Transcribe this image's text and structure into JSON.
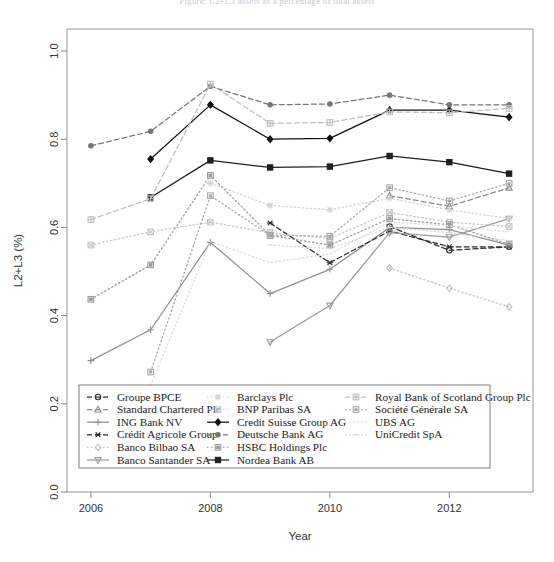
{
  "figure": {
    "title": "Figure: L2+L3 assets as a percentage of total assets",
    "width": 554,
    "height": 562
  },
  "chart_data": {
    "type": "line",
    "title": "",
    "xlabel": "Year",
    "ylabel": "L2+L3 (%)",
    "x": [
      2006,
      2007,
      2008,
      2009,
      2010,
      2011,
      2012,
      2013
    ],
    "xlim": [
      2005.6,
      2013.4
    ],
    "ylim": [
      0.0,
      1.05
    ],
    "xticks": [
      2006,
      2008,
      2010,
      2012
    ],
    "xtick_labels": [
      "2006",
      "2008",
      "2010",
      "2012"
    ],
    "yticks": [
      0.0,
      0.2,
      0.4,
      0.6,
      0.8,
      1.0
    ],
    "ytick_labels": [
      "0.0",
      "0.2",
      "0.4",
      "0.6",
      "0.8",
      "1.0"
    ],
    "grid": false,
    "legend_position": "bottom",
    "legend_columns": 3,
    "series": [
      {
        "name": "Groupe BPCE",
        "symbol": "circle-open",
        "dash": "dashed",
        "color": "#2b2b2b",
        "values": [
          null,
          null,
          null,
          null,
          null,
          0.602,
          0.548,
          0.556
        ]
      },
      {
        "name": "Standard Chartered Plc",
        "symbol": "triangle-open",
        "dash": "dashed",
        "color": "#8c8c8c",
        "values": [
          null,
          null,
          null,
          null,
          null,
          0.672,
          0.648,
          0.69
        ]
      },
      {
        "name": "ING Bank NV",
        "symbol": "plus",
        "dash": "solid",
        "color": "#8f8f8f",
        "values": [
          0.298,
          0.368,
          0.566,
          0.45,
          0.505,
          0.6,
          0.595,
          0.56
        ]
      },
      {
        "name": "Crédit Agricole Group",
        "symbol": "asterisk",
        "dash": "dashed",
        "color": "#2b2b2b",
        "values": [
          null,
          null,
          null,
          0.61,
          0.52,
          0.592,
          0.556,
          0.556
        ]
      },
      {
        "name": "Banco Bilbao SA",
        "symbol": "diamond-open",
        "dash": "dotted",
        "color": "#c0c0c0",
        "values": [
          null,
          null,
          null,
          null,
          null,
          0.508,
          0.462,
          0.42
        ]
      },
      {
        "name": "Banco Santander SA",
        "symbol": "triangle-down-open",
        "dash": "solid",
        "color": "#9a9a9a",
        "values": [
          null,
          null,
          null,
          0.34,
          0.423,
          0.588,
          0.578,
          0.62
        ]
      },
      {
        "name": "Barclays Plc",
        "symbol": "star",
        "dash": "dotted",
        "color": "#d2d2d2",
        "values": [
          null,
          null,
          0.7,
          0.65,
          0.64,
          0.666,
          0.64,
          0.62
        ]
      },
      {
        "name": "BNP Paribas SA",
        "symbol": "square-cross",
        "dash": "dotted",
        "color": "#c6c6c6",
        "values": [
          0.56,
          0.59,
          0.612,
          0.588,
          0.575,
          0.634,
          0.612,
          0.602
        ]
      },
      {
        "name": "Credit Suisse Group AG",
        "symbol": "diamond-filled",
        "dash": "solid",
        "color": "#111111",
        "values": [
          null,
          0.755,
          0.878,
          0.8,
          0.802,
          0.866,
          0.866,
          0.85
        ]
      },
      {
        "name": "Deutsche Bank AG",
        "symbol": "circle-filled",
        "dash": "dashed",
        "color": "#767676",
        "values": [
          0.785,
          0.818,
          0.92,
          0.878,
          0.88,
          0.9,
          0.878,
          0.878
        ]
      },
      {
        "name": "HSBC Holdings Plc",
        "symbol": "square-box",
        "dash": "dotted",
        "color": "#9c9c9c",
        "values": [
          0.437,
          0.515,
          0.718,
          0.582,
          0.56,
          0.62,
          0.606,
          0.562
        ]
      },
      {
        "name": "Nordea Bank AB",
        "symbol": "square-filled",
        "dash": "solid",
        "color": "#1f1f1f",
        "values": [
          null,
          0.668,
          0.752,
          0.736,
          0.738,
          0.762,
          0.748,
          0.722
        ]
      },
      {
        "name": "Royal Bank of Scotland Group Plc",
        "symbol": "square-plus",
        "dash": "dashed",
        "color": "#bdbdbd",
        "values": [
          0.618,
          0.665,
          0.925,
          0.836,
          0.838,
          0.862,
          0.86,
          0.87
        ]
      },
      {
        "name": "Société Générale SA",
        "symbol": "square-dot",
        "dash": "dotted",
        "color": "#a8a8a8",
        "values": [
          null,
          0.272,
          0.672,
          0.582,
          0.58,
          0.69,
          0.66,
          0.7
        ]
      },
      {
        "name": "UBS AG",
        "symbol": "none",
        "dash": "dotted",
        "color": "#dcdcdc",
        "values": [
          null,
          0.242,
          0.568,
          0.52,
          0.54,
          0.612,
          0.604,
          0.59
        ]
      },
      {
        "name": "UniCredit SpA",
        "symbol": "dash",
        "dash": "dotted",
        "color": "#d8d8d8",
        "values": [
          null,
          null,
          null,
          0.56,
          0.552,
          0.6,
          0.588,
          0.57
        ]
      }
    ]
  },
  "legend": {
    "columns": [
      [
        {
          "label": "Groupe BPCE",
          "symbol": "circle-open",
          "dash": "dashed",
          "color": "#2b2b2b"
        },
        {
          "label": "Standard Chartered Plc",
          "symbol": "triangle-open",
          "dash": "dashed",
          "color": "#8c8c8c"
        },
        {
          "label": "ING Bank NV",
          "symbol": "plus",
          "dash": "solid",
          "color": "#8f8f8f"
        },
        {
          "label": "Crédit Agricole Group",
          "symbol": "asterisk",
          "dash": "dashed",
          "color": "#2b2b2b"
        },
        {
          "label": "Banco Bilbao SA",
          "symbol": "diamond-open",
          "dash": "dotted",
          "color": "#c0c0c0"
        },
        {
          "label": "Banco Santander SA",
          "symbol": "triangle-down-open",
          "dash": "solid",
          "color": "#9a9a9a"
        }
      ],
      [
        {
          "label": "Barclays Plc",
          "symbol": "star",
          "dash": "dotted",
          "color": "#d2d2d2"
        },
        {
          "label": "BNP Paribas SA",
          "symbol": "square-cross",
          "dash": "dotted",
          "color": "#c6c6c6"
        },
        {
          "label": "Credit Suisse Group AG",
          "symbol": "diamond-filled",
          "dash": "solid",
          "color": "#111111"
        },
        {
          "label": "Deutsche Bank AG",
          "symbol": "circle-filled",
          "dash": "dashed",
          "color": "#767676"
        },
        {
          "label": "HSBC Holdings Plc",
          "symbol": "square-box",
          "dash": "dotted",
          "color": "#9c9c9c"
        },
        {
          "label": "Nordea Bank AB",
          "symbol": "square-filled",
          "dash": "solid",
          "color": "#1f1f1f"
        }
      ],
      [
        {
          "label": "Royal Bank of Scotland Group Plc",
          "symbol": "square-plus",
          "dash": "dashed",
          "color": "#bdbdbd"
        },
        {
          "label": "Société Générale SA",
          "symbol": "square-dot",
          "dash": "dotted",
          "color": "#a8a8a8"
        },
        {
          "label": "UBS AG",
          "symbol": "none",
          "dash": "dotted",
          "color": "#dcdcdc"
        },
        {
          "label": "UniCredit SpA",
          "symbol": "dash",
          "dash": "dotted",
          "color": "#d8d8d8"
        }
      ]
    ]
  }
}
